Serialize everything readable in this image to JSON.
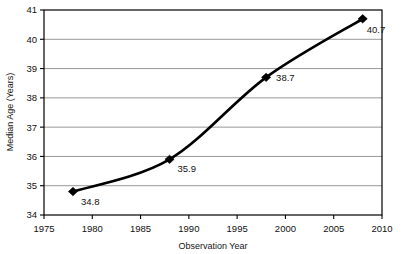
{
  "chart_data": {
    "type": "line",
    "title": "",
    "xlabel": "Observation Year",
    "ylabel": "Median Age (Years)",
    "x": [
      1978,
      1988,
      1998,
      2008
    ],
    "values": [
      34.8,
      35.9,
      38.7,
      40.7
    ],
    "point_labels": [
      "34.8",
      "35.9",
      "38.7",
      "40.7"
    ],
    "xlim": [
      1975,
      2010
    ],
    "ylim": [
      34,
      41
    ],
    "xticks": [
      1975,
      1980,
      1985,
      1990,
      1995,
      2000,
      2005,
      2010
    ],
    "xtick_labels": [
      "1975",
      "1980",
      "1985",
      "1990",
      "1995",
      "2000",
      "2005",
      "2010"
    ],
    "yticks": [
      34,
      35,
      36,
      37,
      38,
      39,
      40,
      41
    ],
    "ytick_labels": [
      "34",
      "35",
      "36",
      "37",
      "38",
      "39",
      "40",
      "41"
    ],
    "grid": "horizontal",
    "legend": "none",
    "marker": "diamond",
    "line_color": "#000000",
    "marker_color": "#000000",
    "grid_color": "#8c8c8c",
    "axis_color": "#000000",
    "smoothing": "spline"
  },
  "axis": {
    "y_title": "Median Age (Years)",
    "x_title": "Observation Year"
  }
}
